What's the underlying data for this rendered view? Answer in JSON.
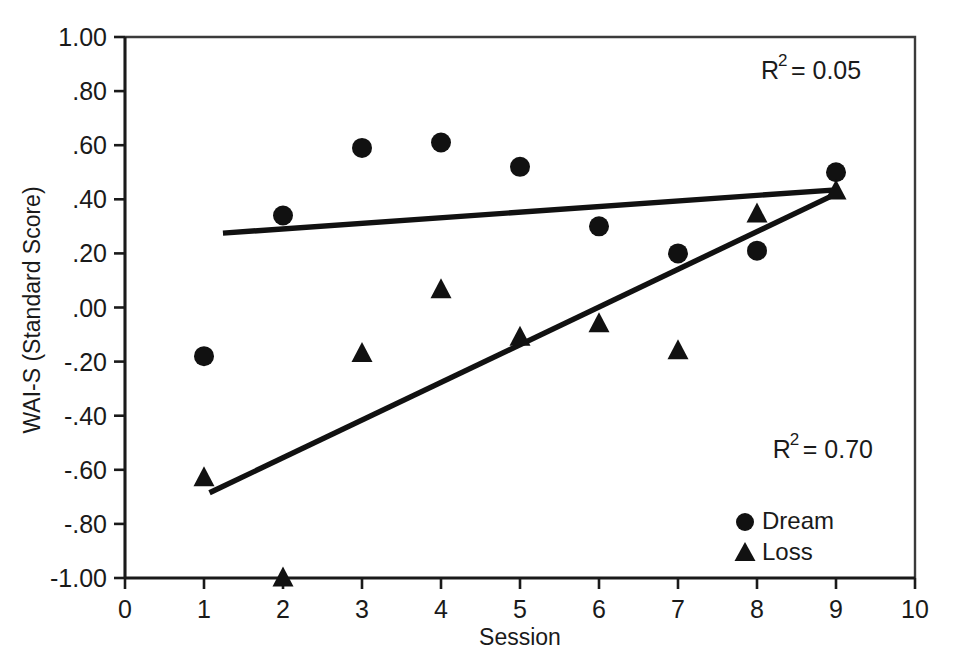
{
  "chart_data": {
    "type": "scatter",
    "title": "",
    "xlabel": "Session",
    "ylabel": "WAI-S (Standard Score)",
    "xlim": [
      0,
      10
    ],
    "ylim": [
      -1.0,
      1.0
    ],
    "grid": false,
    "x_ticks": [
      "0",
      "1",
      "2",
      "3",
      "4",
      "5",
      "6",
      "7",
      "8",
      "9",
      "10"
    ],
    "x_tick_values": [
      0,
      1,
      2,
      3,
      4,
      5,
      6,
      7,
      8,
      9,
      10
    ],
    "y_ticks": [
      "1.00",
      ".80",
      ".60",
      ".40",
      ".20",
      ".00",
      "-.20",
      "-.40",
      "-.60",
      "-.80",
      "-1.00"
    ],
    "y_tick_values": [
      1.0,
      0.8,
      0.6,
      0.4,
      0.2,
      0.0,
      -0.2,
      -0.4,
      -0.6,
      -0.8,
      -1.0
    ],
    "legend_position": "bottom-right",
    "x": [
      1,
      2,
      3,
      4,
      5,
      6,
      7,
      8,
      9
    ],
    "series": [
      {
        "name": "Dream",
        "marker": "circle",
        "color": "#111111",
        "values": [
          -0.18,
          0.34,
          0.59,
          0.61,
          0.52,
          0.3,
          0.2,
          0.21,
          0.5
        ],
        "trend": {
          "x_start": 1.24,
          "y_start": 0.275,
          "x_end": 9.0,
          "y_end": 0.435,
          "r_squared_label": "R2 = 0.05",
          "r_squared": 0.05
        }
      },
      {
        "name": "Loss",
        "marker": "triangle",
        "color": "#111111",
        "values": [
          -0.63,
          -1.0,
          -0.17,
          0.065,
          -0.11,
          -0.06,
          -0.16,
          0.345,
          0.43
        ],
        "trend": {
          "x_start": 1.07,
          "y_start": -0.685,
          "x_end": 9.0,
          "y_end": 0.42,
          "r_squared_label": "R2 = 0.70",
          "r_squared": 0.7
        }
      }
    ],
    "annotations": [
      {
        "id": "r2-dream",
        "base": "R",
        "exponent": "2",
        "rest": " = 0.05",
        "x": 8.05,
        "y": 0.845
      },
      {
        "id": "r2-loss",
        "base": "R",
        "exponent": "2",
        "rest": " = 0.70",
        "x": 8.2,
        "y": -0.555
      }
    ]
  },
  "legend": {
    "items": [
      {
        "label": "Dream",
        "marker": "circle"
      },
      {
        "label": "Loss",
        "marker": "triangle"
      }
    ]
  },
  "axes": {
    "x_title": "Session",
    "y_title": "WAI-S (Standard Score)"
  }
}
